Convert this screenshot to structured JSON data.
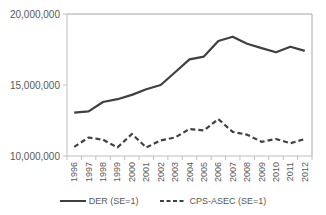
{
  "chart_data": {
    "type": "line",
    "title": "",
    "xlabel": "",
    "ylabel": "",
    "categories": [
      "1996",
      "1997",
      "1998",
      "1999",
      "2000",
      "2001",
      "2002",
      "2003",
      "2004",
      "2005",
      "2006",
      "2007",
      "2008",
      "2009",
      "2010",
      "2011",
      "2012"
    ],
    "series": [
      {
        "name": "DER (SE=1)",
        "style": "solid",
        "color": "#404040",
        "values": [
          13050000,
          13150000,
          13800000,
          14000000,
          14300000,
          14700000,
          15000000,
          15900000,
          16800000,
          17000000,
          18100000,
          18400000,
          17900000,
          17600000,
          17300000,
          17700000,
          17400000
        ]
      },
      {
        "name": "CPS-ASEC (SE=1)",
        "style": "dashed",
        "color": "#404040",
        "values": [
          10650000,
          11300000,
          11150000,
          10600000,
          11550000,
          10600000,
          11100000,
          11300000,
          11900000,
          11800000,
          12600000,
          11700000,
          11500000,
          11000000,
          11200000,
          10900000,
          11200000
        ]
      }
    ],
    "ylim": [
      10000000,
      20000000
    ],
    "yticks": [
      10000000,
      15000000,
      20000000
    ],
    "ytick_labels": [
      "10,000,000",
      "15,000,000",
      "20,000,000"
    ],
    "grid": false,
    "plot_border": true,
    "legend_position": "bottom"
  },
  "legend": {
    "items": [
      {
        "label": "DER (SE=1)",
        "style": "solid"
      },
      {
        "label": "CPS-ASEC (SE=1)",
        "style": "dashed"
      }
    ]
  },
  "colors": {
    "line": "#404040",
    "axis": "#bfbfbf",
    "border": "#a6a6a6",
    "text": "#595959"
  }
}
